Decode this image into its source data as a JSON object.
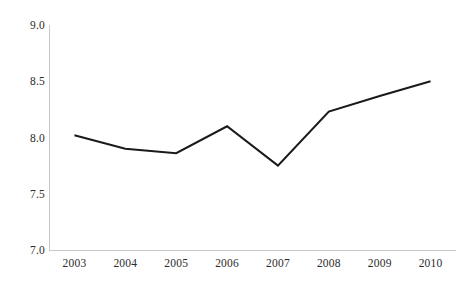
{
  "chart_data": {
    "type": "line",
    "title": "",
    "subtitle": "",
    "xlabel": "",
    "ylabel": "",
    "categories": [
      "2003",
      "2004",
      "2005",
      "2006",
      "2007",
      "2008",
      "2009",
      "2010"
    ],
    "x": [
      2003,
      2004,
      2005,
      2006,
      2007,
      2008,
      2009,
      2010
    ],
    "values": [
      8.02,
      7.9,
      7.86,
      8.1,
      7.75,
      8.23,
      8.37,
      8.5
    ],
    "series": [
      {
        "name": "",
        "values": [
          8.02,
          7.9,
          7.86,
          8.1,
          7.75,
          8.23,
          8.37,
          8.5
        ]
      }
    ],
    "ylim": [
      7.0,
      9.0
    ],
    "yticks": [
      7.0,
      7.5,
      8.0,
      8.5,
      9.0
    ],
    "ytick_labels": [
      "7.0",
      "7.5",
      "8.0",
      "8.5",
      "9.0"
    ],
    "xtick_labels": [
      "2003",
      "2004",
      "2005",
      "2006",
      "2007",
      "2008",
      "2009",
      "2010"
    ],
    "grid": false,
    "legend": "none",
    "line_color": "#1a1a1a",
    "axis_color": "#c9c9c9",
    "background_color": "#ffffff",
    "markers": false
  },
  "axes": {
    "y_ticks": [
      {
        "label": "9.0",
        "value": 9.0
      },
      {
        "label": "8.5",
        "value": 8.5
      },
      {
        "label": "8.0",
        "value": 8.0
      },
      {
        "label": "7.5",
        "value": 7.5
      },
      {
        "label": "7.0",
        "value": 7.0
      }
    ],
    "x_ticks": [
      {
        "label": "2003"
      },
      {
        "label": "2004"
      },
      {
        "label": "2005"
      },
      {
        "label": "2006"
      },
      {
        "label": "2007"
      },
      {
        "label": "2008"
      },
      {
        "label": "2009"
      },
      {
        "label": "2010"
      }
    ]
  }
}
